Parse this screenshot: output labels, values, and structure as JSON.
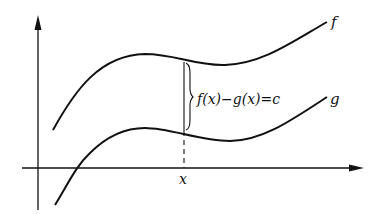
{
  "diagram": {
    "curves": [
      {
        "name": "f",
        "label": "f"
      },
      {
        "name": "g",
        "label": "g"
      }
    ],
    "annotation": {
      "label": "f(x)−g(x)=c"
    },
    "x_marker": {
      "label": "x"
    },
    "axes": {
      "x_axis": "horizontal arrow",
      "y_axis": "vertical arrow"
    },
    "colors": {
      "stroke": "#111111",
      "background": "#ffffff"
    }
  }
}
